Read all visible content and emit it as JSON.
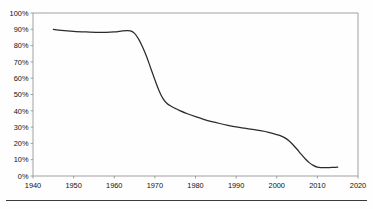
{
  "chart_data": {
    "type": "line",
    "title": "",
    "subtitle": "",
    "xlabel": "",
    "ylabel": "",
    "xlim": [
      1940,
      2020
    ],
    "ylim": [
      0,
      100
    ],
    "grid": false,
    "legend": null,
    "legend_position": "none",
    "y_tick_labels": [
      "100%",
      "90%",
      "80%",
      "70%",
      "60%",
      "50%",
      "40%",
      "30%",
      "20%",
      "10%",
      "0%"
    ],
    "y_tick_values": [
      100,
      90,
      80,
      70,
      60,
      50,
      40,
      30,
      20,
      10,
      0
    ],
    "x_tick_labels": [
      "1940",
      "1950",
      "1960",
      "1970",
      "1980",
      "1990",
      "2000",
      "2010",
      "2020"
    ],
    "x_tick_values": [
      1940,
      1950,
      1960,
      1970,
      1980,
      1990,
      2000,
      2010,
      2020
    ],
    "series": [
      {
        "name": "share",
        "color": "#2b2b2b",
        "x": [
          1945,
          1947,
          1950,
          1953,
          1956,
          1958,
          1960,
          1962,
          1963,
          1964,
          1965,
          1966,
          1967,
          1968,
          1969,
          1970,
          1971,
          1972,
          1973,
          1974,
          1975,
          1976,
          1978,
          1980,
          1982,
          1984,
          1986,
          1988,
          1990,
          1992,
          1994,
          1996,
          1998,
          2000,
          2001,
          2002,
          2003,
          2004,
          2005,
          2006,
          2007,
          2008,
          2009,
          2010,
          2011,
          2012,
          2013,
          2014,
          2015
        ],
        "values": [
          90,
          89.4,
          88.8,
          88.4,
          88.1,
          88.1,
          88.4,
          89,
          89.2,
          89,
          87.5,
          84,
          79,
          73,
          66,
          59,
          52.5,
          47.5,
          44.5,
          42.8,
          41.5,
          40.3,
          38.2,
          36.4,
          34.8,
          33.4,
          32.2,
          31.1,
          30.1,
          29.3,
          28.6,
          27.8,
          26.8,
          25.4,
          24.6,
          23.4,
          21.6,
          19.2,
          16.4,
          13.4,
          10.6,
          8.2,
          6.5,
          5.4,
          5.1,
          5.1,
          5.2,
          5.3,
          5.4
        ]
      }
    ],
    "annotations": [],
    "axis_color": "#8a8a8a",
    "line_color": "#2b2b2b",
    "background_color": "#ffffff"
  },
  "layout": {
    "plot_left": 33,
    "plot_right": 358,
    "plot_top": 13,
    "plot_bottom": 176
  }
}
